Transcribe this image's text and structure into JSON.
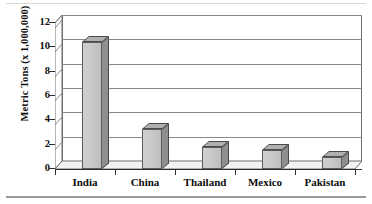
{
  "chart_data": {
    "type": "bar",
    "title": "",
    "subtitle": "",
    "xlabel": "",
    "ylabel": "Metric Tons (x 1,000,000)",
    "categories": [
      "India",
      "China",
      "Thailand",
      "Mexico",
      "Pakistan"
    ],
    "values": [
      10.4,
      3.3,
      1.8,
      1.6,
      1.0
    ],
    "ylim": [
      0,
      12
    ],
    "ytick_labels": [
      "0",
      "2",
      "4",
      "6",
      "8",
      "10",
      "12"
    ],
    "ytick_values": [
      0,
      2,
      4,
      6,
      8,
      10,
      12
    ],
    "grid": "horizontal",
    "legend": "none",
    "style": "3d-column",
    "series": [
      {
        "name": "Production",
        "values": [
          10.4,
          3.3,
          1.8,
          1.6,
          1.0
        ]
      }
    ],
    "colors": {
      "bar_face": "#c9c9c9",
      "bar_side": "#8f8f8f",
      "bar_top": "#b0b0b0",
      "bar_outline": "#4a4a4a",
      "gridline": "#8a8a8a",
      "axis": "#2e2e2e",
      "background": "#ffffff"
    }
  }
}
